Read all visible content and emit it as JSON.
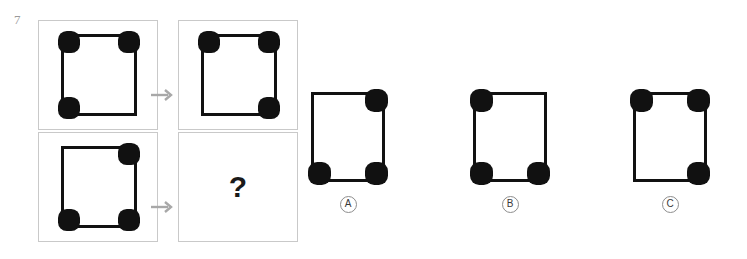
{
  "item": {
    "number": "7",
    "question_mark": "?"
  },
  "arrows": {
    "icon": "arrow-right-icon",
    "color": "#a8a8a8"
  },
  "colors": {
    "dot": "#111111",
    "square_border": "#111111",
    "cell_border": "#c9c9c9",
    "background": "#ffffff",
    "item_number": "#9a9a9a"
  },
  "matrix": {
    "rows": [
      {
        "name": "row-1",
        "left": {
          "name": "cell-a1",
          "dots": [
            "tl",
            "tr",
            "bl"
          ]
        },
        "right": {
          "name": "cell-a2",
          "dots": [
            "tl",
            "tr",
            "br"
          ]
        }
      },
      {
        "name": "row-2",
        "left": {
          "name": "cell-b1",
          "dots": [
            "tr",
            "bl",
            "br"
          ]
        },
        "right": {
          "name": "cell-b2",
          "dots": [],
          "is_question": true
        }
      }
    ]
  },
  "options": [
    {
      "label": "A",
      "dots": [
        "tr",
        "bl",
        "br"
      ]
    },
    {
      "label": "B",
      "dots": [
        "tl",
        "bl",
        "br"
      ]
    },
    {
      "label": "C",
      "dots": [
        "tl",
        "tr",
        "br"
      ]
    }
  ]
}
